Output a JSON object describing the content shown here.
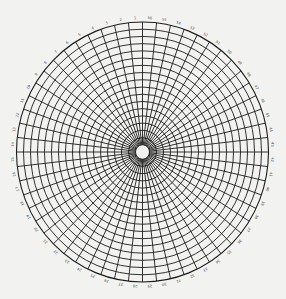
{
  "diagram": {
    "type": "polar-grid",
    "center": {
      "x": 142.5,
      "y": 152
    },
    "radius_x": 126,
    "radius_y": 130,
    "ring_count": 18,
    "spoke_count": 56,
    "label_start": 1,
    "label_direction": "counterclockwise-from-top",
    "line_color": "#1c1c1c",
    "background_color": "#f2f2f0",
    "label_color": "#444444",
    "perimeter_labels_visible": [
      "16",
      "17",
      "18",
      "19",
      "20",
      "21",
      "22",
      "23",
      "24",
      "25",
      "26",
      "27",
      "28",
      "29",
      "30",
      "31",
      "32",
      "33",
      "34",
      "37",
      "38",
      "39",
      "40",
      "41",
      "42",
      "43",
      "44"
    ]
  }
}
